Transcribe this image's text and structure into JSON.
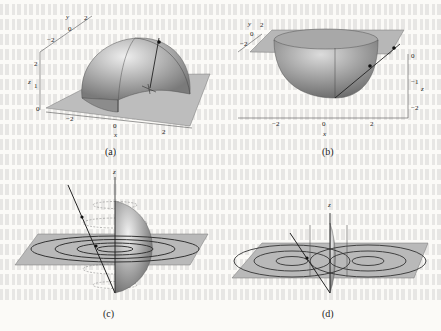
{
  "figure": {
    "panels": [
      {
        "id": "a",
        "caption": "(a)",
        "description": "Upper hemisphere of radius ~2.5 over a square plane z=0, with a vertical line and point",
        "axes": {
          "x_label": "x",
          "x_ticks": [
            "-2",
            "0",
            "2"
          ],
          "y_label": "y",
          "y_ticks": [
            "-2",
            "0",
            "2"
          ],
          "z_label": "z",
          "z_ticks": [
            "0",
            "1",
            "2"
          ]
        }
      },
      {
        "id": "b",
        "caption": "(b)",
        "description": "Lower hemisphere (bowl) below a square plane z=0, with a slanted line through two points",
        "axes": {
          "x_label": "x",
          "x_ticks": [
            "-2",
            "0",
            "2"
          ],
          "y_label": "y",
          "y_ticks": [
            "-2",
            "0",
            "2"
          ],
          "z_label": "z",
          "z_ticks": [
            "0",
            "-1",
            "-2"
          ]
        }
      },
      {
        "id": "c",
        "caption": "(c)",
        "description": "Half sphere with concentric circles on a plane and dashed latitude circles, slanted line with points, z axis",
        "axes": {
          "z_label": "z"
        }
      },
      {
        "id": "d",
        "caption": "(d)",
        "description": "Half sphere with two sets of concentric ellipses on a plane, slanted line with point, z axis",
        "axes": {
          "z_label": "z"
        }
      }
    ]
  }
}
